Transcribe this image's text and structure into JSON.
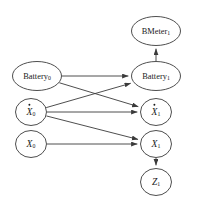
{
  "diagram": {
    "type": "bayesian-network",
    "title": "",
    "background_color": "#ffffff",
    "stroke_color": "#3a3a3a",
    "text_color": "#1a1a1a",
    "nodes": [
      {
        "id": "bmeter1",
        "label": "BMeter",
        "subscript": "1",
        "accent": "none",
        "style": "word",
        "cx": 156,
        "cy": 31,
        "rx": 24.5,
        "ry": 14.5
      },
      {
        "id": "battery0",
        "label": "Battery",
        "subscript": "0",
        "accent": "none",
        "style": "word",
        "cx": 37,
        "cy": 76,
        "rx": 24.5,
        "ry": 14.5
      },
      {
        "id": "battery1",
        "label": "Battery",
        "subscript": "1",
        "accent": "none",
        "style": "word",
        "cx": 156,
        "cy": 76,
        "rx": 24.5,
        "ry": 14.5
      },
      {
        "id": "xdot0",
        "label": "X",
        "subscript": "0",
        "accent": "dot",
        "style": "variable",
        "cx": 31,
        "cy": 112,
        "rx": 15.5,
        "ry": 13.5
      },
      {
        "id": "xdot1",
        "label": "X",
        "subscript": "1",
        "accent": "dot",
        "style": "variable",
        "cx": 156,
        "cy": 112,
        "rx": 15.5,
        "ry": 13.5
      },
      {
        "id": "x0",
        "label": "X",
        "subscript": "0",
        "accent": "none",
        "style": "variable",
        "cx": 31,
        "cy": 144,
        "rx": 15.5,
        "ry": 13.5
      },
      {
        "id": "x1",
        "label": "X",
        "subscript": "1",
        "accent": "none",
        "style": "variable",
        "cx": 156,
        "cy": 144,
        "rx": 15.5,
        "ry": 13.5
      },
      {
        "id": "z1",
        "label": "Z",
        "subscript": "1",
        "accent": "none",
        "style": "variable",
        "cx": 156,
        "cy": 182,
        "rx": 15.5,
        "ry": 13.5
      }
    ],
    "edges": [
      {
        "id": "e-battery1-bmeter1",
        "from": "battery1",
        "to": "bmeter1",
        "arrow": true
      },
      {
        "id": "e-battery0-battery1",
        "from": "battery0",
        "to": "battery1",
        "arrow": true
      },
      {
        "id": "e-battery0-xdot1",
        "from": "battery0",
        "to": "xdot1",
        "arrow": true
      },
      {
        "id": "e-xdot0-battery1",
        "from": "xdot0",
        "to": "battery1",
        "arrow": true
      },
      {
        "id": "e-xdot0-xdot1",
        "from": "xdot0",
        "to": "xdot1",
        "arrow": true
      },
      {
        "id": "e-xdot0-x1",
        "from": "xdot0",
        "to": "x1",
        "arrow": true
      },
      {
        "id": "e-x0-x1",
        "from": "x0",
        "to": "x1",
        "arrow": true
      },
      {
        "id": "e-x1-z1",
        "from": "x1",
        "to": "z1",
        "arrow": true
      }
    ]
  }
}
